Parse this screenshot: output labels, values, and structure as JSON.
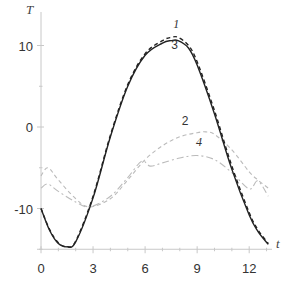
{
  "chart_data": {
    "type": "line",
    "title": "",
    "xlabel": "t",
    "ylabel": "T",
    "xlim": [
      0,
      13.5
    ],
    "ylim": [
      -15,
      13
    ],
    "xticks": [
      0,
      3,
      6,
      9,
      12
    ],
    "yticks": [
      -10,
      0,
      10
    ],
    "grid": false,
    "legend": "inline curve labels",
    "series": [
      {
        "name": "1",
        "style": "dashed",
        "color": "#222222",
        "x": [
          0,
          0.5,
          1,
          1.5,
          2,
          3,
          4,
          5,
          6,
          7,
          7.5,
          7.9,
          8.5,
          9,
          10,
          11,
          12,
          12.5,
          13.1
        ],
        "values": [
          -10,
          -12.6,
          -14.2,
          -14.7,
          -14.0,
          -8.5,
          -1.0,
          5.2,
          9.0,
          10.6,
          11.0,
          11.0,
          10.0,
          8.0,
          2.0,
          -4.8,
          -10.5,
          -12.6,
          -14.3
        ]
      },
      {
        "name": "3",
        "style": "solid",
        "color": "#222222",
        "x": [
          0,
          0.5,
          1,
          1.5,
          2,
          3,
          4,
          5,
          6,
          7,
          7.5,
          7.9,
          8.5,
          9,
          10,
          11,
          12,
          12.5,
          13.1
        ],
        "values": [
          -10,
          -12.7,
          -14.3,
          -14.7,
          -14.1,
          -8.7,
          -1.2,
          5.0,
          8.8,
          10.3,
          10.6,
          10.6,
          9.7,
          7.6,
          1.6,
          -5.2,
          -10.8,
          -12.8,
          -14.4
        ]
      },
      {
        "name": "2",
        "style": "dashed",
        "color": "#bbbbbb",
        "x": [
          0,
          0.4,
          1,
          2,
          2.8,
          4,
          5,
          6,
          7,
          8,
          9,
          9.5,
          10,
          11,
          12,
          12.5,
          13.1
        ],
        "values": [
          -6.0,
          -5.0,
          -6.5,
          -8.8,
          -9.8,
          -8.8,
          -6.5,
          -4.0,
          -2.3,
          -1.2,
          -0.7,
          -0.6,
          -0.9,
          -2.8,
          -5.5,
          -6.5,
          -7.5
        ]
      },
      {
        "name": "4",
        "style": "dash-dot",
        "color": "#bbbbbb",
        "x": [
          0,
          0.4,
          1,
          2,
          2.8,
          4,
          5,
          5.8,
          6.3,
          7,
          8,
          9,
          10,
          11,
          12,
          12.5,
          13.1
        ],
        "values": [
          -7.5,
          -7.0,
          -7.9,
          -9.2,
          -9.8,
          -8.5,
          -6.2,
          -4.2,
          -4.8,
          -4.4,
          -3.8,
          -3.5,
          -4.0,
          -5.6,
          -7.6,
          -6.6,
          -8.5
        ]
      }
    ],
    "annotations": [
      {
        "text": "1",
        "t": 7.8,
        "T": 12.2
      },
      {
        "text": "3",
        "t": 7.7,
        "T": 9.6
      },
      {
        "text": "2",
        "t": 8.3,
        "T": 0.3
      },
      {
        "text": "4",
        "t": 9.1,
        "T": -2.3
      }
    ]
  },
  "axes": {
    "x_title": "t",
    "y_title": "T",
    "x_tick_labels": [
      "0",
      "3",
      "6",
      "9",
      "12"
    ],
    "y_tick_labels": [
      "10",
      "0",
      "-10"
    ]
  },
  "colors": {
    "axis": "#c8c8c8",
    "dark_curve": "#222222",
    "light_curve": "#bbbbbb",
    "text": "#333333"
  }
}
